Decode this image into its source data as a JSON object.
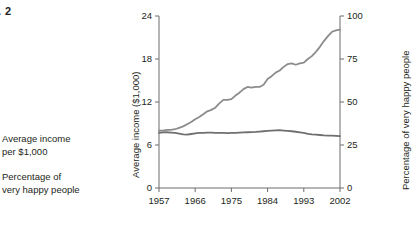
{
  "figure": {
    "caption": ". 2"
  },
  "legend": {
    "entries": [
      {
        "label": "Average income\nper $1,000",
        "color": "#8c8c8c"
      },
      {
        "label": "Percentage of\nvery happy people",
        "color": "#6f6f6f"
      }
    ]
  },
  "chart_data": {
    "type": "line",
    "title": "",
    "xlabel": "",
    "ylabel": "Average income ($1,000)",
    "y2label": "Percentage of very happy people",
    "grid": false,
    "legend_position": "left-outside",
    "xlim": [
      1957,
      2002
    ],
    "ylim": [
      0,
      24
    ],
    "y2lim": [
      0,
      100
    ],
    "xticks": [
      1957,
      1966,
      1975,
      1984,
      1993,
      2002
    ],
    "xticklabels": [
      "1957",
      "1966",
      "1975",
      "1984",
      "1993",
      "2002"
    ],
    "yticks": [
      0,
      6,
      12,
      18,
      24
    ],
    "yticklabels": [
      "0",
      "6",
      "12",
      "18",
      "24"
    ],
    "y2ticks": [
      0,
      25,
      50,
      75,
      100
    ],
    "y2ticklabels": [
      "0",
      "25",
      "50",
      "75",
      "100"
    ],
    "series": [
      {
        "name": "Average income per $1,000",
        "axis": "left",
        "color": "#8c8c8c",
        "x": [
          1957,
          1958,
          1959,
          1960,
          1961,
          1962,
          1963,
          1964,
          1965,
          1966,
          1967,
          1968,
          1969,
          1970,
          1971,
          1972,
          1973,
          1974,
          1975,
          1976,
          1977,
          1978,
          1979,
          1980,
          1981,
          1982,
          1983,
          1984,
          1985,
          1986,
          1987,
          1988,
          1989,
          1990,
          1991,
          1992,
          1993,
          1994,
          1995,
          1996,
          1997,
          1998,
          1999,
          2000,
          2001,
          2002
        ],
        "y": [
          8.0,
          8.0,
          8.1,
          8.1,
          8.2,
          8.4,
          8.6,
          8.9,
          9.2,
          9.6,
          9.9,
          10.3,
          10.7,
          10.9,
          11.2,
          11.8,
          12.3,
          12.3,
          12.4,
          12.9,
          13.3,
          13.8,
          14.1,
          14.0,
          14.1,
          14.1,
          14.4,
          15.2,
          15.6,
          16.1,
          16.4,
          16.9,
          17.3,
          17.4,
          17.2,
          17.4,
          17.5,
          18.0,
          18.4,
          19.0,
          19.7,
          20.5,
          21.2,
          21.8,
          22.0,
          22.1
        ]
      },
      {
        "name": "Percentage of very happy people",
        "axis": "right",
        "color": "#6f6f6f",
        "x": [
          1957,
          1958,
          1959,
          1960,
          1961,
          1962,
          1963,
          1964,
          1965,
          1966,
          1967,
          1968,
          1969,
          1970,
          1971,
          1972,
          1973,
          1974,
          1975,
          1976,
          1977,
          1978,
          1979,
          1980,
          1981,
          1982,
          1983,
          1984,
          1985,
          1986,
          1987,
          1988,
          1989,
          1990,
          1991,
          1992,
          1993,
          1994,
          1995,
          1996,
          1997,
          1998,
          1999,
          2000,
          2001,
          2002
        ],
        "y": [
          32.0,
          32.3,
          32.4,
          32.2,
          32.0,
          31.6,
          31.2,
          31.0,
          31.4,
          31.8,
          32.0,
          32.1,
          32.2,
          32.2,
          32.1,
          32.0,
          32.0,
          31.9,
          32.0,
          32.1,
          32.2,
          32.3,
          32.4,
          32.5,
          32.6,
          32.8,
          33.0,
          33.2,
          33.4,
          33.5,
          33.6,
          33.4,
          33.2,
          33.0,
          32.7,
          32.4,
          32.0,
          31.5,
          31.2,
          31.0,
          30.8,
          30.6,
          30.5,
          30.4,
          30.3,
          30.2
        ]
      }
    ]
  },
  "colors": {
    "axis": "#6d6d6d",
    "text": "#231f20",
    "series_income": "#8c8c8c",
    "series_happiness": "#6f6f6f",
    "background": "#ffffff"
  }
}
